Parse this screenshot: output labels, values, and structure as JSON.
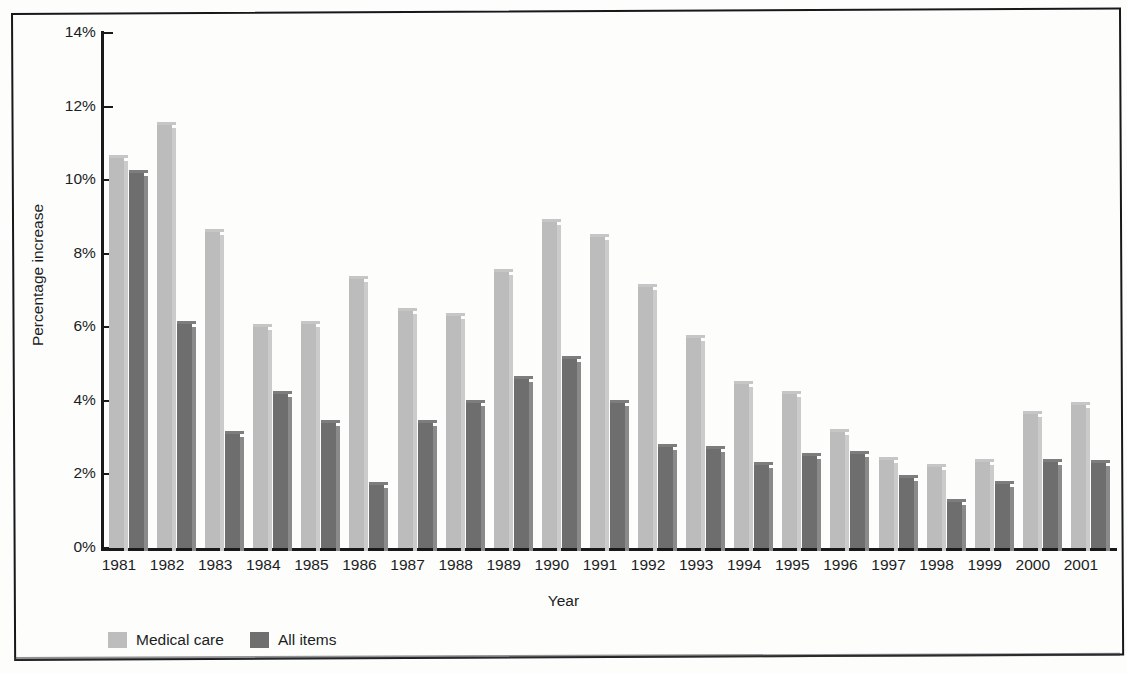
{
  "axes": {
    "ylabel": "Percentage increase",
    "xlabel": "Year",
    "y_ticks": [
      "14%",
      "12%",
      "10%",
      "8%",
      "6%",
      "4%",
      "2%",
      "0%"
    ]
  },
  "legend": {
    "items": [
      {
        "label": "Medical care",
        "color": "#bdbdbd"
      },
      {
        "label": "All items",
        "color": "#6f6f6f"
      }
    ]
  },
  "chart_data": {
    "type": "bar",
    "title": "",
    "subtitle": "",
    "xlabel": "Year",
    "ylabel": "Percentage increase",
    "ylim": [
      0,
      14
    ],
    "y_tick_values": [
      0,
      2,
      4,
      6,
      8,
      10,
      12,
      14
    ],
    "y_tick_labels": [
      "0%",
      "2%",
      "4%",
      "6%",
      "8%",
      "10%",
      "12%",
      "14%"
    ],
    "grid": false,
    "legend_position": "bottom-left",
    "categories": [
      "1981",
      "1982",
      "1983",
      "1984",
      "1985",
      "1986",
      "1987",
      "1988",
      "1989",
      "1990",
      "1991",
      "1992",
      "1993",
      "1994",
      "1995",
      "1996",
      "1997",
      "1998",
      "1999",
      "2000",
      "2001"
    ],
    "series": [
      {
        "name": "Medical care",
        "color": "#bdbdbd",
        "values": [
          10.6,
          11.5,
          8.6,
          6.0,
          6.1,
          7.3,
          6.45,
          6.3,
          7.5,
          8.85,
          8.45,
          7.1,
          5.7,
          4.45,
          4.2,
          3.15,
          2.4,
          2.2,
          2.35,
          3.65,
          3.9
        ]
      },
      {
        "name": "All items",
        "color": "#6f6f6f",
        "values": [
          10.2,
          6.1,
          3.1,
          4.2,
          3.4,
          1.7,
          3.4,
          3.95,
          4.6,
          5.15,
          3.95,
          2.75,
          2.7,
          2.25,
          2.5,
          2.55,
          1.9,
          1.25,
          1.75,
          2.35,
          2.3
        ]
      }
    ]
  }
}
